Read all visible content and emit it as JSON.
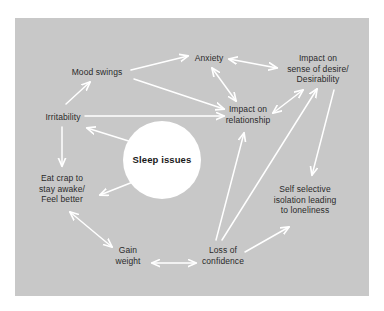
{
  "canvas": {
    "background_color": "#ffffff",
    "panel_color": "#c8c8c8",
    "arrow_color": "#ffffff",
    "text_color": "#2a2a2a",
    "center_node_fill": "#ffffff"
  },
  "diagram": {
    "type": "concept-map",
    "center": {
      "id": "sleep-issues",
      "label": "Sleep issues",
      "shape": "circle",
      "cx": 162,
      "cy": 160,
      "r": 39
    },
    "nodes": [
      {
        "id": "mood-swings",
        "label": "Mood swings",
        "x": 97,
        "y": 72
      },
      {
        "id": "anxiety",
        "label": "Anxiety",
        "x": 209,
        "y": 58
      },
      {
        "id": "impact-desire",
        "label": "Impact on\nsense of desire/\nDesirability",
        "x": 318,
        "y": 69
      },
      {
        "id": "irritability",
        "label": "Irritability",
        "x": 63,
        "y": 117
      },
      {
        "id": "impact-relationship",
        "label": "Impact on\nrelationship",
        "x": 248,
        "y": 114
      },
      {
        "id": "eat-crap",
        "label": "Eat crap to\nstay awake/\nFeel better",
        "x": 62,
        "y": 189
      },
      {
        "id": "self-isolation",
        "label": "Self selective\nisolation leading\nto loneliness",
        "x": 305,
        "y": 200
      },
      {
        "id": "gain-weight",
        "label": "Gain\nweight",
        "x": 128,
        "y": 255
      },
      {
        "id": "loss-confidence",
        "label": "Loss of\nconfidence",
        "x": 223,
        "y": 255
      }
    ],
    "edges": [
      {
        "from": "irritability",
        "to": "mood-swings",
        "heads": "single"
      },
      {
        "from": "mood-swings",
        "to": "anxiety",
        "heads": "single"
      },
      {
        "from": "mood-swings",
        "to": "impact-relationship",
        "heads": "single"
      },
      {
        "from": "anxiety",
        "to": "impact-desire",
        "heads": "double"
      },
      {
        "from": "anxiety",
        "to": "impact-relationship",
        "heads": "double"
      },
      {
        "from": "irritability",
        "to": "impact-relationship",
        "heads": "single"
      },
      {
        "from": "irritability",
        "to": "eat-crap",
        "heads": "single"
      },
      {
        "from": "sleep-issues",
        "to": "irritability",
        "heads": "single"
      },
      {
        "from": "sleep-issues",
        "to": "eat-crap",
        "heads": "single"
      },
      {
        "from": "impact-relationship",
        "to": "impact-desire",
        "heads": "double"
      },
      {
        "from": "impact-desire",
        "to": "self-isolation",
        "heads": "single"
      },
      {
        "from": "loss-confidence",
        "to": "impact-relationship",
        "heads": "single"
      },
      {
        "from": "loss-confidence",
        "to": "impact-desire",
        "heads": "single"
      },
      {
        "from": "loss-confidence",
        "to": "self-isolation",
        "heads": "single"
      },
      {
        "from": "gain-weight",
        "to": "loss-confidence",
        "heads": "double"
      },
      {
        "from": "eat-crap",
        "to": "gain-weight",
        "heads": "double"
      }
    ]
  }
}
